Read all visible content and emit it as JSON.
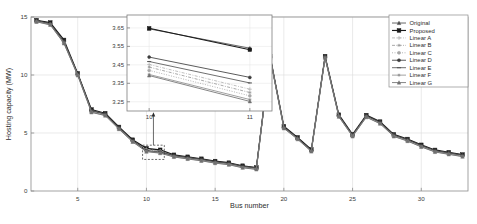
{
  "figure": {
    "background": "#ffffff",
    "axis_color": "#8c8c8c",
    "grid_color": "#dcdcdc"
  },
  "chart_data": {
    "type": "line",
    "title": "",
    "xlabel": "Bus number",
    "ylabel": "Hosting capacity (MW)",
    "xlim": [
      1.6,
      33.4
    ],
    "ylim": [
      0,
      15
    ],
    "xticks": [
      5,
      10,
      15,
      20,
      25,
      30
    ],
    "yticks": [
      0,
      5,
      10,
      15
    ],
    "grid": true,
    "legend_position": "top-right",
    "x": [
      2,
      3,
      4,
      5,
      6,
      7,
      8,
      9,
      10,
      11,
      12,
      13,
      14,
      15,
      16,
      17,
      18,
      19,
      20,
      21,
      22,
      23,
      24,
      25,
      26,
      27,
      28,
      29,
      30,
      31,
      32,
      33
    ],
    "series": [
      {
        "name": "Original",
        "color": "#4d4d4d",
        "marker": "triangle",
        "linestyle": "solid",
        "values": [
          14.7,
          14.45,
          12.85,
          10.1,
          6.9,
          6.62,
          5.45,
          4.35,
          3.62,
          3.48,
          3.05,
          2.88,
          2.72,
          2.52,
          2.38,
          2.12,
          1.98,
          11.58,
          5.52,
          4.58,
          3.52,
          11.58,
          6.52,
          4.82,
          6.48,
          5.92,
          4.82,
          4.42,
          3.92,
          3.48,
          3.28,
          3.08
        ]
      },
      {
        "name": "Proposed",
        "color": "#1a1a1a",
        "marker": "square",
        "linestyle": "solid",
        "values": [
          14.72,
          14.52,
          13.02,
          10.14,
          7.02,
          6.7,
          5.52,
          4.42,
          3.68,
          3.55,
          3.12,
          2.95,
          2.78,
          2.58,
          2.44,
          2.18,
          2.02,
          11.62,
          5.58,
          4.62,
          3.58,
          11.62,
          6.58,
          4.88,
          6.54,
          5.98,
          4.88,
          4.48,
          3.98,
          3.54,
          3.34,
          3.14
        ]
      },
      {
        "name": "Linear A",
        "color": "#b5b5b5",
        "marker": "plus",
        "linestyle": "dashdot",
        "values": [
          14.66,
          14.4,
          12.8,
          10.05,
          6.86,
          6.58,
          5.41,
          4.31,
          3.58,
          3.44,
          3.01,
          2.84,
          2.68,
          2.48,
          2.34,
          2.08,
          1.94,
          11.54,
          5.48,
          4.54,
          3.48,
          11.54,
          6.48,
          4.78,
          6.44,
          5.88,
          4.78,
          4.38,
          3.88,
          3.44,
          3.24,
          3.04
        ]
      },
      {
        "name": "Linear B",
        "color": "#9a9a9a",
        "marker": "star",
        "linestyle": "dashdot",
        "values": [
          14.64,
          14.38,
          12.78,
          10.02,
          6.84,
          6.56,
          5.39,
          4.29,
          3.55,
          3.41,
          2.99,
          2.82,
          2.66,
          2.46,
          2.32,
          2.06,
          1.92,
          11.52,
          5.46,
          4.52,
          3.46,
          11.52,
          6.46,
          4.76,
          6.42,
          5.86,
          4.76,
          4.36,
          3.86,
          3.42,
          3.22,
          3.02
        ]
      },
      {
        "name": "Linear C",
        "color": "#a8a8a8",
        "marker": "circle",
        "linestyle": "dotted",
        "values": [
          14.62,
          14.36,
          12.76,
          10.0,
          6.82,
          6.54,
          5.37,
          4.27,
          3.52,
          3.38,
          2.97,
          2.8,
          2.64,
          2.44,
          2.3,
          2.04,
          1.9,
          11.5,
          5.44,
          4.5,
          3.44,
          11.5,
          6.44,
          4.74,
          6.4,
          5.84,
          4.74,
          4.34,
          3.84,
          3.4,
          3.2,
          3.0
        ]
      },
      {
        "name": "Linear D",
        "color": "#3d3d3d",
        "marker": "circle",
        "linestyle": "solid",
        "values": [
          14.68,
          14.42,
          12.9,
          10.08,
          6.95,
          6.65,
          5.47,
          4.37,
          3.48,
          3.35,
          3.07,
          2.9,
          2.74,
          2.54,
          2.4,
          2.14,
          2.0,
          11.56,
          5.5,
          4.56,
          3.5,
          11.56,
          6.5,
          4.84,
          6.5,
          5.94,
          4.84,
          4.44,
          3.94,
          3.5,
          3.3,
          3.1
        ]
      },
      {
        "name": "Linear E",
        "color": "#555555",
        "marker": "dash",
        "linestyle": "solid",
        "values": [
          14.67,
          14.41,
          12.88,
          10.06,
          6.92,
          6.63,
          5.44,
          4.34,
          3.45,
          3.32,
          3.04,
          2.87,
          2.71,
          2.51,
          2.37,
          2.11,
          1.97,
          11.55,
          5.49,
          4.55,
          3.49,
          11.55,
          6.49,
          4.83,
          6.47,
          5.91,
          4.81,
          4.41,
          3.91,
          3.47,
          3.27,
          3.07
        ]
      },
      {
        "name": "Linear F",
        "color": "#919191",
        "marker": "star",
        "linestyle": "solid",
        "values": [
          14.6,
          14.34,
          12.74,
          9.98,
          6.8,
          6.52,
          5.35,
          4.25,
          3.42,
          3.29,
          2.95,
          2.78,
          2.62,
          2.42,
          2.28,
          2.02,
          1.88,
          11.48,
          5.42,
          4.48,
          3.42,
          11.48,
          6.42,
          4.72,
          6.38,
          5.82,
          4.72,
          4.32,
          3.82,
          3.38,
          3.18,
          2.98
        ]
      },
      {
        "name": "Linear G",
        "color": "#707070",
        "marker": "triangle",
        "linestyle": "solid",
        "values": [
          14.58,
          14.32,
          12.72,
          9.96,
          6.78,
          6.5,
          5.33,
          4.23,
          3.39,
          3.26,
          2.93,
          2.76,
          2.6,
          2.4,
          2.26,
          2.0,
          1.86,
          11.46,
          5.4,
          4.46,
          3.4,
          11.46,
          6.4,
          4.7,
          6.36,
          5.8,
          4.7,
          4.3,
          3.8,
          3.36,
          3.16,
          2.96
        ]
      }
    ],
    "inset": {
      "xlim": [
        9.78,
        11.22
      ],
      "ylim": [
        3.2,
        3.72
      ],
      "xticks": [
        10,
        11
      ],
      "yticks": [
        3.25,
        3.35,
        3.45,
        3.55,
        3.65
      ],
      "grid": true,
      "x": [
        10,
        11
      ],
      "series": [
        {
          "name": "Original",
          "color": "#4d4d4d",
          "marker": "triangle",
          "linestyle": "solid",
          "values": [
            3.645,
            3.54
          ]
        },
        {
          "name": "Proposed",
          "color": "#1a1a1a",
          "marker": "square",
          "linestyle": "solid",
          "values": [
            3.648,
            3.532
          ]
        },
        {
          "name": "Linear A",
          "color": "#b5b5b5",
          "marker": "plus",
          "linestyle": "dashdot",
          "values": [
            3.452,
            3.318
          ]
        },
        {
          "name": "Linear B",
          "color": "#9a9a9a",
          "marker": "star",
          "linestyle": "dashdot",
          "values": [
            3.438,
            3.3
          ]
        },
        {
          "name": "Linear C",
          "color": "#a8a8a8",
          "marker": "circle",
          "linestyle": "dotted",
          "values": [
            3.42,
            3.282
          ]
        },
        {
          "name": "Linear D",
          "color": "#3d3d3d",
          "marker": "circle",
          "linestyle": "solid",
          "values": [
            3.492,
            3.382
          ]
        },
        {
          "name": "Linear E",
          "color": "#555555",
          "marker": "dash",
          "linestyle": "solid",
          "values": [
            3.468,
            3.352
          ]
        },
        {
          "name": "Linear F",
          "color": "#919191",
          "marker": "star",
          "linestyle": "solid",
          "values": [
            3.398,
            3.262
          ]
        },
        {
          "name": "Linear G",
          "color": "#707070",
          "marker": "triangle",
          "linestyle": "solid",
          "values": [
            3.392,
            3.252
          ]
        }
      ],
      "callout": {
        "bus": 10.5,
        "capacity": 3.45
      }
    }
  },
  "legend": {
    "entries": [
      "Original",
      "Proposed",
      "Linear A",
      "Linear B",
      "Linear C",
      "Linear D",
      "Linear E",
      "Linear F",
      "Linear G"
    ]
  },
  "axis_labels": {
    "x": "Bus number",
    "y": "Hosting capacity (MW)"
  },
  "tick_labels": {
    "main_x": [
      "5",
      "10",
      "15",
      "20",
      "25",
      "30"
    ],
    "main_y": [
      "0",
      "5",
      "10",
      "15"
    ],
    "inset_x": [
      "10",
      "11"
    ],
    "inset_y": [
      "3.25",
      "3.35",
      "3.45",
      "3.55",
      "3.65"
    ]
  }
}
